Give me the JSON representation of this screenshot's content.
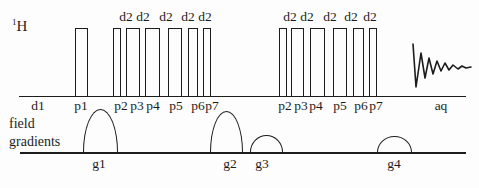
{
  "h_channel": {
    "isotope": "1",
    "element": "H",
    "baseline": {
      "x": 19,
      "y": 95.5,
      "width": 447,
      "thickness": 1.7
    },
    "pulse_top_y": 28,
    "pulses": [
      {
        "id": "p1",
        "x": 75,
        "w": 13
      },
      {
        "id": "p2a",
        "x": 113,
        "w": 8
      },
      {
        "id": "p3a",
        "x": 126,
        "w": 13.5
      },
      {
        "id": "p4a",
        "x": 145,
        "w": 14.5
      },
      {
        "id": "p5a",
        "x": 168,
        "w": 14
      },
      {
        "id": "p6a",
        "x": 188,
        "w": 10
      },
      {
        "id": "p7a",
        "x": 203,
        "w": 7.5
      },
      {
        "id": "p2b",
        "x": 279,
        "w": 8
      },
      {
        "id": "p3b",
        "x": 291,
        "w": 13
      },
      {
        "id": "p4b",
        "x": 310,
        "w": 15
      },
      {
        "id": "p5b",
        "x": 333,
        "w": 14
      },
      {
        "id": "p6b",
        "x": 353,
        "w": 11
      },
      {
        "id": "p7b",
        "x": 369,
        "w": 7.5
      }
    ],
    "delay_label": "d2",
    "delay_label_centers_x": [
      126,
      143,
      166,
      188,
      205,
      290,
      307,
      330,
      351,
      370
    ],
    "timing_labels": [
      {
        "text": "d1",
        "x": 38
      },
      {
        "text": "p1",
        "x": 81
      },
      {
        "text": "p2",
        "x": 121
      },
      {
        "text": "p3",
        "x": 137
      },
      {
        "text": "p4",
        "x": 153
      },
      {
        "text": "p5",
        "x": 176
      },
      {
        "text": "p6",
        "x": 198
      },
      {
        "text": "p7",
        "x": 212
      },
      {
        "text": "p2",
        "x": 285
      },
      {
        "text": "p3",
        "x": 301
      },
      {
        "text": "p4",
        "x": 316
      },
      {
        "text": "p5",
        "x": 340
      },
      {
        "text": "p6",
        "x": 361
      },
      {
        "text": "p7",
        "x": 376
      },
      {
        "text": "aq",
        "x": 441
      }
    ],
    "fid_points": [
      [
        413,
        44
      ],
      [
        416,
        87
      ],
      [
        421,
        53
      ],
      [
        425,
        78
      ],
      [
        429,
        58
      ],
      [
        433,
        74
      ],
      [
        437,
        61
      ],
      [
        441,
        71
      ],
      [
        445,
        63
      ],
      [
        449,
        70
      ],
      [
        453,
        65
      ],
      [
        458,
        69
      ],
      [
        462,
        66
      ],
      [
        466,
        68
      ],
      [
        471,
        67
      ]
    ]
  },
  "gradients": {
    "label_line1": "field",
    "label_line2": "gradients",
    "baseline": {
      "x": 20,
      "y": 152,
      "width": 446,
      "thickness": 2
    },
    "pulses": [
      {
        "id": "g1",
        "label": "g1",
        "x": 83,
        "w": 35,
        "h": 43,
        "label_x": 99
      },
      {
        "id": "g2",
        "label": "g2",
        "x": 210,
        "w": 33,
        "h": 41,
        "label_x": 230
      },
      {
        "id": "g3",
        "label": "g3",
        "x": 250,
        "w": 33,
        "h": 17,
        "label_x": 262
      },
      {
        "id": "g4",
        "label": "g4",
        "x": 377,
        "w": 35,
        "h": 16,
        "label_x": 394
      }
    ]
  },
  "ink_color": "#1c1c1c"
}
